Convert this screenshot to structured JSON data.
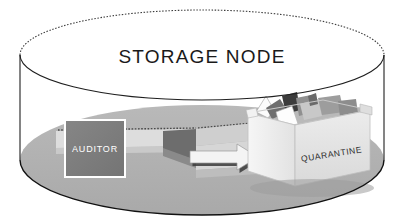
{
  "diagram": {
    "title": "STORAGE NODE",
    "container_label": "STORAGE NODE",
    "nodes": {
      "auditor": {
        "label": "AUDITOR",
        "shape": "square",
        "fill_color": "#7e7e7e",
        "border_color": "#ffffff",
        "text_color": "#ffffff"
      },
      "quarantine": {
        "label": "QUARANTINE",
        "shape": "open-box-3d",
        "fill_color": "#e6e6e6",
        "text_color": "#2a2a2a",
        "contents": "crumpled papers"
      }
    },
    "flow": {
      "arrow_label": "",
      "direction": "auditor-to-quarantine",
      "arrow_color": "#f2f2f2",
      "arrow_outline": "#222222"
    },
    "container": {
      "shape": "cylinder",
      "floor_color": "#b4b4b4",
      "wall_color": "#ffffff",
      "outline_color": "#1a1a1a"
    }
  }
}
